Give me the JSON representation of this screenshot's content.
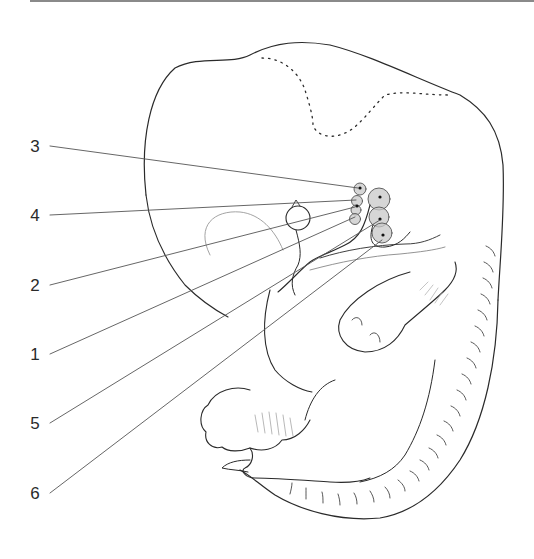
{
  "figure": {
    "labels": [
      {
        "id": "3",
        "text": "3",
        "x": 34,
        "y": 146,
        "target": [
          358,
          188
        ]
      },
      {
        "id": "4",
        "text": "4",
        "x": 34,
        "y": 205,
        "target": [
          356,
          200
        ]
      },
      {
        "id": "2",
        "text": "2",
        "x": 34,
        "y": 275,
        "target": [
          355,
          207
        ]
      },
      {
        "id": "1",
        "text": "1",
        "x": 34,
        "y": 344,
        "target": [
          355,
          217
        ]
      },
      {
        "id": "5",
        "text": "5",
        "x": 34,
        "y": 413,
        "target": [
          380,
          220
        ]
      },
      {
        "id": "6",
        "text": "6",
        "x": 34,
        "y": 483,
        "target": [
          382,
          240
        ]
      }
    ],
    "colors": {
      "line": "#2a2a2a",
      "leader": "#555555",
      "gland_fill": "#c8c8c8",
      "rule": "#8a8a8a"
    }
  }
}
